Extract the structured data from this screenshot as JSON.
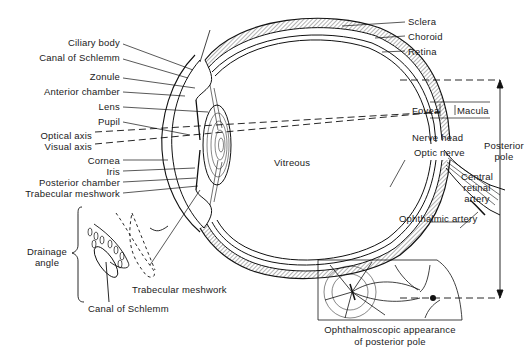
{
  "diagram": {
    "left_labels": [
      {
        "id": "ciliary_body",
        "text": "Ciliary body"
      },
      {
        "id": "canal_of_schlemm",
        "text": "Canal of Schlemm"
      },
      {
        "id": "zonule",
        "text": "Zonule"
      },
      {
        "id": "anterior_chamber",
        "text": "Anterior chamber"
      },
      {
        "id": "lens",
        "text": "Lens"
      },
      {
        "id": "pupil",
        "text": "Pupil"
      },
      {
        "id": "optical_axis",
        "text": "Optical axis"
      },
      {
        "id": "visual_axis",
        "text": "Visual axis"
      },
      {
        "id": "cornea",
        "text": "Cornea"
      },
      {
        "id": "iris",
        "text": "Iris"
      },
      {
        "id": "posterior_chamber",
        "text": "Posterior chamber"
      },
      {
        "id": "trabecular_meshwork",
        "text": "Trabecular meshwork"
      }
    ],
    "right_labels": [
      {
        "id": "sclera",
        "text": "Sclera"
      },
      {
        "id": "choroid",
        "text": "Choroid"
      },
      {
        "id": "retina",
        "text": "Retina"
      },
      {
        "id": "fovea",
        "text": "Fovea"
      },
      {
        "id": "macula",
        "text": "Macula"
      },
      {
        "id": "nerve_head",
        "text": "Nerve head"
      },
      {
        "id": "optic_nerve",
        "text": "Optic nerve"
      },
      {
        "id": "central_retinal_artery",
        "text": "Central\nretinal\nartery"
      },
      {
        "id": "ophthalmic_artery",
        "text": "Ophthalmic artery"
      },
      {
        "id": "posterior_pole",
        "text": "Posterior\npole"
      }
    ],
    "center_label": "Vitreous",
    "inset_drainage": {
      "bracket_label": "Drainage angle",
      "bracket_label_line1": "Drainage",
      "bracket_label_line2": "angle",
      "trabecular_label": "Trabecular meshwork",
      "canal_label": "Canal of Schlemm"
    },
    "inset_fundus": {
      "caption_line1": "Ophthalmoscopic appearance",
      "caption_line2": "of posterior pole"
    }
  }
}
